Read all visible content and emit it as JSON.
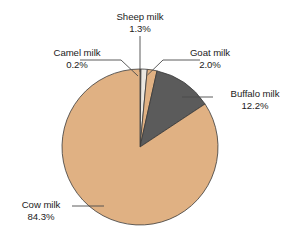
{
  "chart_data": {
    "type": "pie",
    "title": "",
    "subtitle": "",
    "xlabel": "",
    "ylabel": "",
    "legend_position": "none",
    "grid": false,
    "labels_mode": "callout-leader-lines",
    "unit": "%",
    "categories": [
      "Camel milk",
      "Sheep milk",
      "Goat milk",
      "Buffalo milk",
      "Cow milk"
    ],
    "values": [
      0.2,
      1.3,
      2.0,
      12.2,
      84.3
    ],
    "start_angle_deg": 0,
    "direction": "clockwise",
    "slices": [
      {
        "name": "Camel milk",
        "value": 0.2,
        "value_label": "0.2%",
        "color": "#e0b183",
        "start_deg": 0.0,
        "end_deg": 0.72
      },
      {
        "name": "Sheep milk",
        "value": 1.3,
        "value_label": "1.3%",
        "color": "#ebe7e0",
        "start_deg": 0.72,
        "end_deg": 5.4
      },
      {
        "name": "Goat milk",
        "value": 2.0,
        "value_label": "2.0%",
        "color": "#e0b183",
        "start_deg": 5.4,
        "end_deg": 12.6
      },
      {
        "name": "Buffalo milk",
        "value": 12.2,
        "value_label": "12.2%",
        "color": "#5b5b5b",
        "start_deg": 12.6,
        "end_deg": 56.52
      },
      {
        "name": "Cow milk",
        "value": 84.3,
        "value_label": "84.3%",
        "color": "#e0b183",
        "start_deg": 56.52,
        "end_deg": 360.0
      }
    ]
  },
  "labels": {
    "sheep": {
      "name": "Sheep milk",
      "value": "1.3%"
    },
    "camel": {
      "name": "Camel milk",
      "value": "0.2%"
    },
    "goat": {
      "name": "Goat milk",
      "value": "2.0%"
    },
    "buffalo": {
      "name": "Buffalo milk",
      "value": "12.2%"
    },
    "cow": {
      "name": "Cow milk",
      "value": "84.3%"
    }
  },
  "style": {
    "background": "#ffffff",
    "text_color": "#1b1b1b",
    "outline_color": "#3a3a3a",
    "leader_color": "#4a4a4a",
    "tan": "#e0b183",
    "gray": "#5b5b5b",
    "pale": "#ebe7e0"
  }
}
